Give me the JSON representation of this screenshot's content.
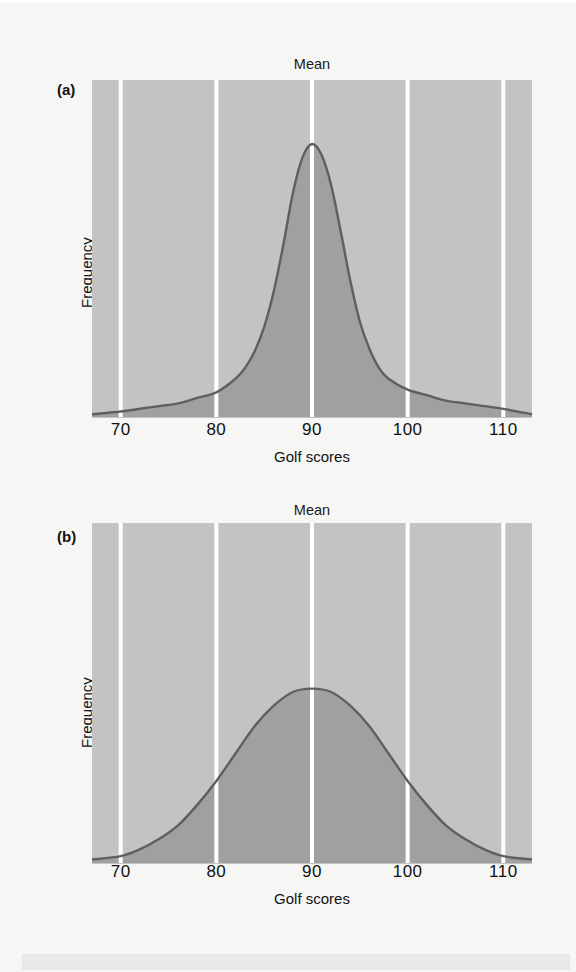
{
  "figure": {
    "background_color": "#f6f6f5",
    "plot_background_color": "#c3c3c3",
    "area_fill_color": "#a0a0a0",
    "curve_color": "#5f5f5f",
    "gridline_color": "#ffffff"
  },
  "panels": [
    {
      "tag": "(a)",
      "mean_label": "Mean",
      "x_axis_label": "Golf scores",
      "y_axis_label": "Frequency",
      "tick_labels": [
        "70",
        "80",
        "90",
        "100",
        "110"
      ]
    },
    {
      "tag": "(b)",
      "mean_label": "Mean",
      "x_axis_label": "Golf scores",
      "y_axis_label": "Frequency",
      "tick_labels": [
        "70",
        "80",
        "90",
        "100",
        "110"
      ]
    }
  ],
  "chart_data": [
    {
      "type": "area",
      "panel": "(a)",
      "title": "Mean",
      "xlabel": "Golf scores",
      "ylabel": "Frequency",
      "xlim": [
        67,
        113
      ],
      "ylim": [
        0,
        1
      ],
      "xticks": [
        70,
        80,
        90,
        100,
        110
      ],
      "grid": true,
      "legend": "none",
      "annotations": [
        "Mean at x = 90"
      ],
      "description": "Leptokurtic (narrow, peaked) distribution of golf scores centered at the mean of 90 with small spread; heavy tails.",
      "distribution": {
        "family": "normal-like peaked",
        "mean": 90,
        "std_dev": 3.2,
        "peak_x": 90,
        "peak_y": 1.0
      },
      "x": [
        67,
        70,
        72,
        74,
        76,
        78,
        80,
        82,
        83,
        84,
        85,
        86,
        87,
        88,
        89,
        90,
        91,
        92,
        93,
        94,
        95,
        96,
        97,
        98,
        100,
        102,
        104,
        106,
        108,
        110,
        113
      ],
      "y": [
        0.01,
        0.02,
        0.03,
        0.04,
        0.05,
        0.07,
        0.09,
        0.14,
        0.18,
        0.24,
        0.33,
        0.46,
        0.63,
        0.82,
        0.95,
        1.0,
        0.96,
        0.85,
        0.68,
        0.5,
        0.35,
        0.25,
        0.18,
        0.14,
        0.1,
        0.08,
        0.06,
        0.05,
        0.04,
        0.03,
        0.01
      ]
    },
    {
      "type": "area",
      "panel": "(b)",
      "title": "Mean",
      "xlabel": "Golf scores",
      "ylabel": "Frequency",
      "xlim": [
        67,
        113
      ],
      "ylim": [
        0,
        1
      ],
      "xticks": [
        70,
        80,
        90,
        100,
        110
      ],
      "grid": true,
      "legend": "none",
      "annotations": [
        "Mean at x = 90"
      ],
      "description": "Platykurtic (wide, flat) distribution of golf scores centered at the mean of 90 with large spread.",
      "distribution": {
        "family": "normal",
        "mean": 90,
        "std_dev": 8.5,
        "peak_x": 90,
        "peak_y": 0.51
      },
      "x": [
        67,
        70,
        72,
        74,
        76,
        78,
        80,
        82,
        84,
        86,
        88,
        90,
        92,
        94,
        96,
        98,
        100,
        102,
        104,
        106,
        108,
        110,
        113
      ],
      "y": [
        0.01,
        0.02,
        0.04,
        0.07,
        0.11,
        0.17,
        0.24,
        0.32,
        0.4,
        0.46,
        0.5,
        0.51,
        0.5,
        0.46,
        0.4,
        0.32,
        0.24,
        0.17,
        0.11,
        0.07,
        0.04,
        0.02,
        0.01
      ]
    }
  ]
}
